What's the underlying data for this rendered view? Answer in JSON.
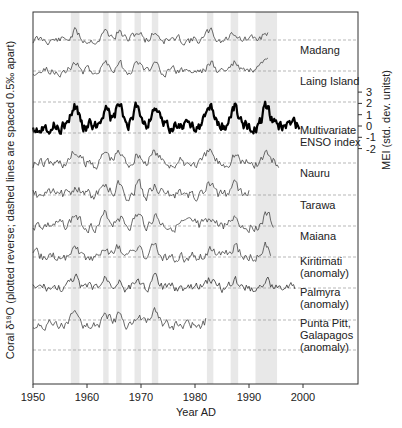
{
  "chart_data": {
    "type": "line",
    "title": "",
    "xlabel": "Year AD",
    "ylabel": "Coral δ¹⁸O (plotted reverse; dashed lines are spaced 0.5‰ apart)",
    "ylabel_right": "MEI (std. dev. unitst)",
    "xlim": [
      1950,
      2005
    ],
    "x_ticks": [
      1950,
      1960,
      1970,
      1980,
      1990,
      2000
    ],
    "mei_ticks": [
      3,
      2,
      1,
      0,
      -1,
      -2
    ],
    "grid": "dashed horizontal reference lines every 0.5 permil",
    "el_nino_bands": [
      [
        1957.0,
        1958.6
      ],
      [
        1963.0,
        1964.0
      ],
      [
        1965.4,
        1966.4
      ],
      [
        1968.8,
        1970.0
      ],
      [
        1972.0,
        1973.2
      ],
      [
        1982.2,
        1983.4
      ],
      [
        1986.6,
        1988.0
      ],
      [
        1991.2,
        1995.2
      ]
    ],
    "series": [
      {
        "name": "Madang",
        "label_lines": [
          "Madang"
        ],
        "baseline": 40,
        "start": 1950,
        "end": 1993.5,
        "seed": 11,
        "amp": 9,
        "width": 0.8,
        "color": "#444444"
      },
      {
        "name": "Laing Island",
        "label_lines": [
          "Laing Island"
        ],
        "baseline": 71,
        "start": 1950,
        "end": 1993.5,
        "seed": 23,
        "amp": 9,
        "width": 0.8,
        "color": "#444444"
      },
      {
        "name": "Multivariate ENSO index",
        "label_lines": [
          "Multivariate",
          "ENSO index"
        ],
        "baseline": 126,
        "start": 1950,
        "end": 1999.5,
        "seed": 37,
        "amp": 12,
        "width": 2.2,
        "color": "#000000"
      },
      {
        "name": "Nauru",
        "label_lines": [
          "Nauru"
        ],
        "baseline": 163,
        "start": 1950,
        "end": 1995.5,
        "seed": 41,
        "amp": 12,
        "width": 0.8,
        "color": "#444444"
      },
      {
        "name": "Tarawa",
        "label_lines": [
          "Tarawa"
        ],
        "baseline": 195,
        "start": 1950,
        "end": 1990.0,
        "seed": 53,
        "amp": 12,
        "width": 0.8,
        "color": "#444444"
      },
      {
        "name": "Maiana",
        "label_lines": [
          "Maiana"
        ],
        "baseline": 226,
        "start": 1950,
        "end": 1994.5,
        "seed": 67,
        "amp": 11,
        "width": 0.8,
        "color": "#444444"
      },
      {
        "name": "Kiritimati (anomaly)",
        "label_lines": [
          "Kiritimati",
          "(anomaly)"
        ],
        "baseline": 257,
        "start": 1950,
        "end": 1994.0,
        "seed": 71,
        "amp": 11,
        "width": 0.8,
        "color": "#444444"
      },
      {
        "name": "Palmyra (anomaly)",
        "label_lines": [
          "Palmyra",
          "(anomaly)"
        ],
        "baseline": 288,
        "start": 1950,
        "end": 1998.5,
        "seed": 83,
        "amp": 10,
        "width": 0.8,
        "color": "#333333"
      },
      {
        "name": "Punta Pitt, Galapagos (anomaly)",
        "label_lines": [
          "Punta Pitt,",
          "Galapagos",
          "(anomaly)"
        ],
        "baseline": 325,
        "start": 1950,
        "end": 1982.0,
        "seed": 97,
        "amp": 11,
        "width": 0.8,
        "color": "#444444"
      }
    ],
    "dashed_lines_y": [
      40,
      71,
      102,
      133,
      163,
      195,
      226,
      257,
      288,
      320,
      350
    ]
  }
}
